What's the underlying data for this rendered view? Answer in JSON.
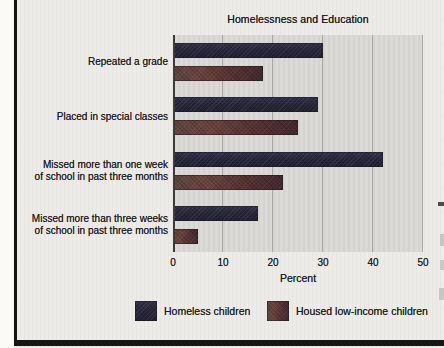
{
  "page": {
    "background_color": "#edebe8",
    "margin_color": "#fbfaf7",
    "rule_color": "#151515"
  },
  "chart_data": {
    "type": "bar",
    "orientation": "horizontal",
    "title": "Homelessness and Education",
    "xlabel": "Percent",
    "xlim": [
      0,
      50
    ],
    "xticks": [
      0,
      10,
      20,
      30,
      40,
      50
    ],
    "grid": true,
    "plot_background": "#dcdad7",
    "gridline_color": "#a9a8a5",
    "legend_position": "bottom",
    "categories": [
      "Repeated a grade",
      "Placed in special classes",
      "Missed more than one week\nof school in past three months",
      "Missed more than three weeks\nof school in past three months"
    ],
    "series": [
      {
        "name": "Homeless children",
        "color": "#26253a",
        "values": [
          30,
          29,
          42,
          17
        ]
      },
      {
        "name": "Housed low-income children",
        "color": "#5d3a36",
        "values": [
          18,
          25,
          22,
          5
        ]
      }
    ]
  }
}
